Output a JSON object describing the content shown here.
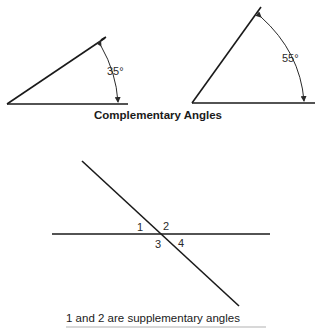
{
  "complementary": {
    "title": "Complementary Angles",
    "angles": [
      {
        "label": "35°",
        "degrees": 35
      },
      {
        "label": "55°",
        "degrees": 55
      }
    ]
  },
  "supplementary": {
    "angle_labels": [
      "1",
      "2",
      "3",
      "4"
    ],
    "caption": "1 and 2 are supplementary angles"
  },
  "colors": {
    "line": "#1a1a1a",
    "background": "#ffffff"
  }
}
